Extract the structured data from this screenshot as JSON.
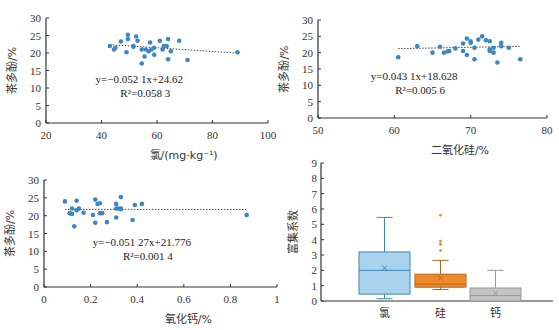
{
  "chart_data": [
    {
      "type": "scatter",
      "id": "chlorine",
      "xlabel": "氯/(mg·kg⁻¹)",
      "ylabel": "茶多酚/%",
      "xlim": [
        20,
        100
      ],
      "ylim": [
        0,
        30
      ],
      "xticks": [
        20,
        40,
        60,
        80,
        100
      ],
      "yticks": [
        0,
        5,
        10,
        15,
        20,
        25,
        30
      ],
      "equation": "y=−0.052 1x+24.62",
      "r2": "R²=0.058 3",
      "trend": {
        "slope": -0.0521,
        "intercept": 24.62,
        "x_range": [
          43,
          89
        ]
      },
      "points": [
        [
          43,
          22
        ],
        [
          44.5,
          21
        ],
        [
          45,
          21.5
        ],
        [
          47,
          23.3
        ],
        [
          49,
          20.2
        ],
        [
          49.5,
          24
        ],
        [
          49.5,
          25.2
        ],
        [
          51.5,
          22
        ],
        [
          51.5,
          21.8
        ],
        [
          52.5,
          24.7
        ],
        [
          53,
          23.5
        ],
        [
          54.5,
          21
        ],
        [
          54.5,
          17
        ],
        [
          55.5,
          19
        ],
        [
          56,
          21
        ],
        [
          57,
          20.5
        ],
        [
          57.5,
          23
        ],
        [
          58,
          21
        ],
        [
          59,
          21.5
        ],
        [
          59,
          19.5
        ],
        [
          61,
          23.5
        ],
        [
          62,
          21
        ],
        [
          62.5,
          22
        ],
        [
          63.5,
          22
        ],
        [
          64,
          24
        ],
        [
          64,
          18.2
        ],
        [
          65,
          20.5
        ],
        [
          68,
          23.5
        ],
        [
          71,
          18
        ],
        [
          89,
          20.2
        ]
      ],
      "frame": {
        "x0": 46,
        "x1": 268,
        "y0": 123,
        "y1": 18
      }
    },
    {
      "type": "scatter",
      "id": "silica",
      "xlabel": "二氧化硅/%",
      "ylabel": "茶多酚/%",
      "xlim": [
        50,
        80
      ],
      "ylim": [
        0,
        30
      ],
      "xticks": [
        50,
        60,
        70,
        80
      ],
      "yticks": [
        0,
        5,
        10,
        15,
        20,
        25,
        30
      ],
      "equation": "y=0.043 1x+18.628",
      "r2": "R²=0.005 6",
      "trend": {
        "slope": 0.0431,
        "intercept": 18.628,
        "x_range": [
          60.5,
          76.5
        ]
      },
      "points": [
        [
          60.5,
          18.6
        ],
        [
          63,
          22
        ],
        [
          65,
          20
        ],
        [
          66,
          21.8
        ],
        [
          66.5,
          20
        ],
        [
          67,
          20.4
        ],
        [
          67.2,
          20.5
        ],
        [
          68,
          21.3
        ],
        [
          69,
          22.8
        ],
        [
          69,
          20.5
        ],
        [
          69.5,
          19.3
        ],
        [
          69.5,
          24.3
        ],
        [
          70,
          23
        ],
        [
          70,
          23.5
        ],
        [
          70.5,
          21.5
        ],
        [
          70.5,
          18
        ],
        [
          71,
          24
        ],
        [
          71.5,
          25
        ],
        [
          72,
          23.8
        ],
        [
          72.5,
          23.5
        ],
        [
          72.5,
          21
        ],
        [
          72.5,
          20.5
        ],
        [
          73,
          20
        ],
        [
          73,
          21.5
        ],
        [
          73.5,
          17
        ],
        [
          74,
          22
        ],
        [
          74,
          23
        ],
        [
          75,
          21.5
        ],
        [
          76.5,
          18
        ]
      ],
      "frame": {
        "x0": 318,
        "x1": 547,
        "y0": 118,
        "y1": 20
      }
    },
    {
      "type": "scatter",
      "id": "calcium-oxide",
      "xlabel": "氧化钙/%",
      "ylabel": "茶多酚/%",
      "xlim": [
        0,
        1
      ],
      "ylim": [
        0,
        30
      ],
      "xticks": [
        0,
        0.2,
        0.4,
        0.6,
        0.8,
        1
      ],
      "yticks": [
        0,
        5,
        10,
        15,
        20,
        25,
        30
      ],
      "equation": "y=−0.051 27x+21.776",
      "r2": "R²=0.001 4",
      "trend": {
        "slope": -0.05127,
        "intercept": 21.776,
        "x_range": [
          0.09,
          0.87
        ]
      },
      "points": [
        [
          0.09,
          24
        ],
        [
          0.11,
          20.7
        ],
        [
          0.12,
          20.5
        ],
        [
          0.12,
          22
        ],
        [
          0.13,
          17
        ],
        [
          0.14,
          21.5
        ],
        [
          0.14,
          24.2
        ],
        [
          0.15,
          22
        ],
        [
          0.17,
          20.8
        ],
        [
          0.21,
          20.2
        ],
        [
          0.22,
          24.5
        ],
        [
          0.22,
          18
        ],
        [
          0.23,
          23.3
        ],
        [
          0.24,
          23.5
        ],
        [
          0.24,
          20.7
        ],
        [
          0.25,
          20.7
        ],
        [
          0.27,
          18.2
        ],
        [
          0.31,
          23.3
        ],
        [
          0.31,
          22
        ],
        [
          0.31,
          19.5
        ],
        [
          0.32,
          22
        ],
        [
          0.33,
          25.2
        ],
        [
          0.33,
          22
        ],
        [
          0.33,
          21.8
        ],
        [
          0.38,
          18.8
        ],
        [
          0.39,
          23
        ],
        [
          0.42,
          23.3
        ],
        [
          0.87,
          20.2
        ]
      ],
      "frame": {
        "x0": 44,
        "x1": 277,
        "y0": 287,
        "y1": 180
      }
    },
    {
      "type": "box",
      "id": "enrichment",
      "ylabel": "富集系数",
      "ylim": [
        0,
        9
      ],
      "yticks": [
        0,
        1,
        2,
        3,
        4,
        5,
        6,
        7,
        8,
        9
      ],
      "categories": [
        "氯",
        "硅",
        "钙"
      ],
      "series": [
        {
          "name": "氯",
          "min": 0.15,
          "q1": 0.45,
          "median": 2.0,
          "q3": 3.2,
          "max": 5.45,
          "mean": 2.15,
          "outliers": [],
          "fill": "#a9d2ec",
          "stroke": "#3b86bd"
        },
        {
          "name": "硅",
          "min": 0.75,
          "q1": 0.9,
          "median": 1.1,
          "q3": 1.75,
          "max": 2.65,
          "mean": 1.5,
          "outliers": [
            3.3,
            3.7,
            3.9,
            5.6
          ],
          "fill": "#ef8a2a",
          "stroke": "#b5651d"
        },
        {
          "name": "钙",
          "min": 0.0,
          "q1": 0.0,
          "median": 0.35,
          "q3": 0.85,
          "max": 2.0,
          "mean": 0.5,
          "outliers": [],
          "fill": "#c4c4c4",
          "stroke": "#999999"
        }
      ],
      "frame": {
        "x0": 321,
        "x1": 553,
        "y0": 301,
        "y1": 163
      }
    }
  ],
  "colors": {
    "point": "#3d86c6",
    "axis": "#333333",
    "trend": "#333333"
  }
}
